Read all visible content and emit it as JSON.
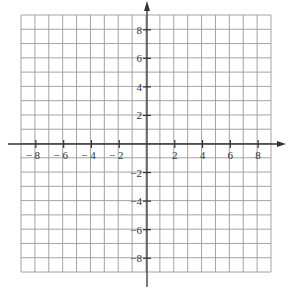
{
  "diagram": {
    "type": "coordinate-plane",
    "grid": {
      "xmin": -9,
      "xmax": 9,
      "ymin": -9,
      "ymax": 9,
      "step": 1,
      "color": "#9a9a9a"
    },
    "axis_color": "#333333",
    "x_axis": {
      "ticks": [
        -8,
        -6,
        -4,
        -2,
        2,
        4,
        6,
        8
      ],
      "labels": [
        "− 8",
        "− 6",
        "− 4",
        "− 2",
        "2",
        "4",
        "6",
        "8"
      ]
    },
    "y_axis": {
      "ticks": [
        8,
        6,
        4,
        2,
        -2,
        -4,
        -6,
        -8
      ],
      "labels": [
        "8",
        "6",
        "4",
        "2",
        "−2",
        "−4",
        "−6",
        "−8"
      ]
    }
  }
}
